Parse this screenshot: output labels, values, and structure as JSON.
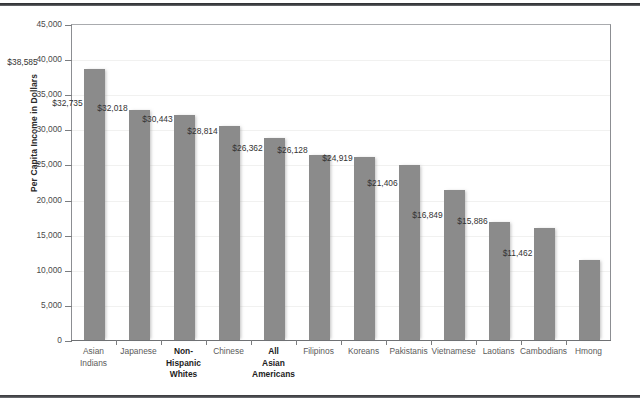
{
  "chart_data": {
    "type": "bar",
    "title": "",
    "subtitle": "",
    "xlabel": "",
    "ylabel": "Per Capita Income in Dollars",
    "ylim": [
      0,
      45000
    ],
    "ytick_step": 5000,
    "ytick_labels": [
      "0",
      "5,000",
      "10,000",
      "15,000",
      "20,000",
      "25,000",
      "30,000",
      "35,000",
      "40,000",
      "45,000"
    ],
    "ytick_values": [
      0,
      5000,
      10000,
      15000,
      20000,
      25000,
      30000,
      35000,
      40000,
      45000
    ],
    "grid": true,
    "legend": null,
    "bar_color": "#8b8b8b",
    "categories": [
      "Asian\nIndians",
      "Japanese",
      "Non-\nHispanic\nWhites",
      "Chinese",
      "All\nAsian\nAmericans",
      "Filipinos",
      "Koreans",
      "Pakistanis",
      "Vietnamese",
      "Laotians",
      "Cambodians",
      "Hmong"
    ],
    "category_emphasis": [
      false,
      false,
      true,
      false,
      true,
      false,
      false,
      false,
      false,
      false,
      false,
      false
    ],
    "values": [
      38585,
      32735,
      32018,
      30443,
      28814,
      26362,
      26128,
      24919,
      21406,
      16849,
      15886,
      11462
    ],
    "value_labels": [
      "$38,585",
      "$32,735",
      "$32,018",
      "$30,443",
      "$28,814",
      "$26,362",
      "$26,128",
      "$24,919",
      "$21,406",
      "$16,849",
      "$15,886",
      "$11,462"
    ]
  }
}
